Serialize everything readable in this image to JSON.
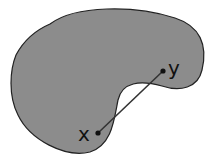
{
  "diagram": {
    "shape": {
      "fill": "#8c8c8c",
      "stroke": "#222222"
    },
    "segment": {
      "color": "#333333"
    },
    "points": [
      {
        "label": "x",
        "cx": 98,
        "cy": 133
      },
      {
        "label": "y",
        "cx": 163,
        "cy": 71
      }
    ]
  }
}
